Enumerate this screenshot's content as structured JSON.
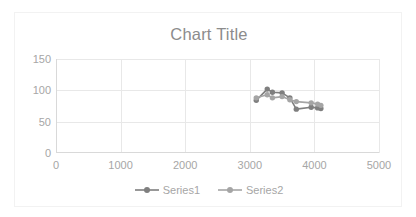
{
  "chart_data": {
    "type": "line",
    "title": "Chart Title",
    "xlabel": "",
    "ylabel": "",
    "xlim": [
      0,
      5000
    ],
    "ylim": [
      0,
      150
    ],
    "xticks": [
      0,
      1000,
      2000,
      3000,
      4000,
      5000
    ],
    "yticks": [
      0,
      50,
      100,
      150
    ],
    "grid": true,
    "legend_position": "bottom",
    "colors": {
      "series1": "#7f7f7f",
      "series2": "#a5a5a5",
      "grid": "#e8e8e8",
      "axis": "#d9d9d9",
      "text": "#a6a6a6",
      "title": "#8c8c8c",
      "border": "#f2f2f2",
      "background": "#ffffff"
    },
    "series": [
      {
        "name": "Series1",
        "x": [
          3100,
          3270,
          3350,
          3500,
          3620,
          3720,
          3950,
          4050,
          4100
        ],
        "y": [
          84,
          102,
          97,
          96,
          88,
          70,
          73,
          72,
          71
        ]
      },
      {
        "name": "Series2",
        "x": [
          3100,
          3270,
          3350,
          3500,
          3620,
          3720,
          3950,
          4050,
          4100
        ],
        "y": [
          88,
          93,
          88,
          90,
          85,
          82,
          80,
          78,
          76
        ]
      }
    ]
  },
  "legend": {
    "items": [
      {
        "label": "Series1"
      },
      {
        "label": "Series2"
      }
    ]
  }
}
